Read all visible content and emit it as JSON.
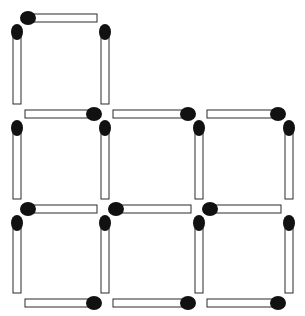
{
  "grid": {
    "rows": 3,
    "cols": 3,
    "filled_cells": [
      [
        0,
        0
      ],
      [
        1,
        0
      ],
      [
        1,
        1
      ],
      [
        1,
        2
      ],
      [
        2,
        0
      ],
      [
        2,
        1
      ],
      [
        2,
        2
      ]
    ]
  },
  "matchstick_count": 22,
  "colors": {
    "background": "#ffffff",
    "stick_fill": "#ffffff",
    "stick_outline": "#2a2a2a",
    "match_head": "#111111"
  },
  "matches": [
    {
      "id": "r0-top-c0",
      "orientation": "horizontal",
      "row_line": 0,
      "col": 0,
      "head": "start"
    },
    {
      "id": "r0-left",
      "orientation": "vertical",
      "row": 0,
      "col_line": 0,
      "head": "start"
    },
    {
      "id": "r0-right",
      "orientation": "vertical",
      "row": 0,
      "col_line": 1,
      "head": "start"
    },
    {
      "id": "h1-c0",
      "orientation": "horizontal",
      "row_line": 1,
      "col": 0,
      "head": "end"
    },
    {
      "id": "h1-c1",
      "orientation": "horizontal",
      "row_line": 1,
      "col": 1,
      "head": "end"
    },
    {
      "id": "h1-c2",
      "orientation": "horizontal",
      "row_line": 1,
      "col": 2,
      "head": "end"
    },
    {
      "id": "v1-l0",
      "orientation": "vertical",
      "row": 1,
      "col_line": 0,
      "head": "start"
    },
    {
      "id": "v1-l1",
      "orientation": "vertical",
      "row": 1,
      "col_line": 1,
      "head": "start"
    },
    {
      "id": "v1-l2",
      "orientation": "vertical",
      "row": 1,
      "col_line": 2,
      "head": "start"
    },
    {
      "id": "v1-l3",
      "orientation": "vertical",
      "row": 1,
      "col_line": 3,
      "head": "start"
    },
    {
      "id": "h2-c0",
      "orientation": "horizontal",
      "row_line": 2,
      "col": 0,
      "head": "start"
    },
    {
      "id": "h2-c1",
      "orientation": "horizontal",
      "row_line": 2,
      "col": 1,
      "head": "start"
    },
    {
      "id": "h2-c2",
      "orientation": "horizontal",
      "row_line": 2,
      "col": 2,
      "head": "start"
    },
    {
      "id": "v2-l0",
      "orientation": "vertical",
      "row": 2,
      "col_line": 0,
      "head": "start"
    },
    {
      "id": "v2-l1",
      "orientation": "vertical",
      "row": 2,
      "col_line": 1,
      "head": "start"
    },
    {
      "id": "v2-l2",
      "orientation": "vertical",
      "row": 2,
      "col_line": 2,
      "head": "start"
    },
    {
      "id": "v2-l3",
      "orientation": "vertical",
      "row": 2,
      "col_line": 3,
      "head": "start"
    },
    {
      "id": "h3-c0",
      "orientation": "horizontal",
      "row_line": 3,
      "col": 0,
      "head": "end"
    },
    {
      "id": "h3-c1",
      "orientation": "horizontal",
      "row_line": 3,
      "col": 1,
      "head": "end"
    },
    {
      "id": "h3-c2",
      "orientation": "horizontal",
      "row_line": 3,
      "col": 2,
      "head": "end"
    }
  ]
}
